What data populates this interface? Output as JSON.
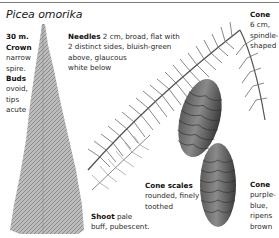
{
  "page": {
    "title": "Picea omorika"
  },
  "labels": {
    "height": {
      "bold": "30 m."
    },
    "crown": {
      "bold": "Crown",
      "lines": [
        "narrow",
        "spire."
      ]
    },
    "buds": {
      "bold": "Buds",
      "lines": [
        "ovoid,",
        "tips",
        "acute"
      ]
    },
    "needles": {
      "bold": "Needles",
      "first": " 2 cm, broad, flat with",
      "lines": [
        "2 distinct sides, bluish-green",
        "above, glaucous",
        "white below"
      ]
    },
    "cone_top": {
      "bold": "Cone",
      "lines": [
        "6 cm,",
        "spindle-",
        "shaped"
      ]
    },
    "cone_scales": {
      "bold": "Cone scales",
      "lines": [
        "rounded, finely",
        "toothed"
      ]
    },
    "shoot": {
      "bold": "Shoot",
      "first": " pale",
      "lines": [
        "buff, pubescent."
      ]
    },
    "cone_bottom": {
      "bold": "Cone",
      "lines": [
        "purple-",
        "blue,",
        "ripens",
        "brown"
      ]
    }
  },
  "illustrations": {
    "tree": "narrow spire conifer silhouette",
    "branch": "needled branch with two hanging cones",
    "shoot": "small pale shoot sprig"
  },
  "colors": {
    "ink": "#1a1a1a",
    "rule": "#7a7a7a",
    "foliage": "#8a8a8a",
    "cone_dark": "#4a4a4a"
  }
}
